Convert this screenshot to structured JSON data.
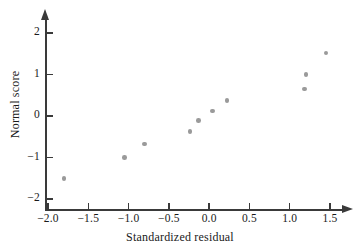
{
  "chart_data": {
    "type": "scatter",
    "title": "",
    "xlabel": "Standardized residual",
    "ylabel": "Normal score",
    "xlim": [
      -2.0,
      1.5
    ],
    "ylim": [
      -2.0,
      2.0
    ],
    "grid": false,
    "legend": null,
    "x_ticks": [
      {
        "value": -2.0,
        "label": "−2.0"
      },
      {
        "value": -1.5,
        "label": "−1.5"
      },
      {
        "value": -1.0,
        "label": "−1.0"
      },
      {
        "value": -0.5,
        "label": "−0.5"
      },
      {
        "value": 0.0,
        "label": "0.0"
      },
      {
        "value": 0.5,
        "label": "0.5"
      },
      {
        "value": 1.0,
        "label": "1.0"
      },
      {
        "value": 1.5,
        "label": "1.5"
      }
    ],
    "y_ticks": [
      {
        "value": 2,
        "label": "2"
      },
      {
        "value": 1,
        "label": "1"
      },
      {
        "value": 0,
        "label": "0"
      },
      {
        "value": -1,
        "label": "−1"
      },
      {
        "value": -2,
        "label": "−2"
      }
    ],
    "marker_color": "#9a9a9a",
    "axis_color": "#3a3a3a",
    "points": [
      {
        "x": -1.8,
        "y": -1.5
      },
      {
        "x": -1.05,
        "y": -1.0
      },
      {
        "x": -0.8,
        "y": -0.67
      },
      {
        "x": -0.24,
        "y": -0.37
      },
      {
        "x": -0.13,
        "y": -0.11
      },
      {
        "x": 0.04,
        "y": 0.12
      },
      {
        "x": 0.22,
        "y": 0.37
      },
      {
        "x": 1.18,
        "y": 0.65
      },
      {
        "x": 1.2,
        "y": 1.0
      },
      {
        "x": 1.45,
        "y": 1.52
      }
    ]
  }
}
